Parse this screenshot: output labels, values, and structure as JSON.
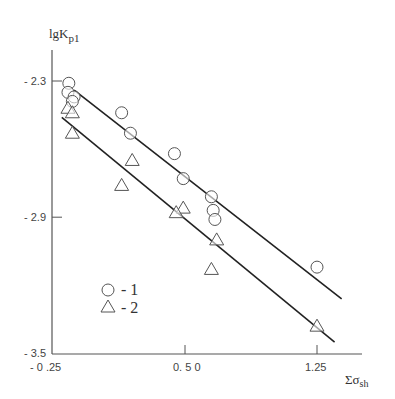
{
  "chart_data": {
    "type": "scatter",
    "title": "",
    "xlabel": "Σσsh",
    "ylabel": "lgKp1",
    "xlim": [
      -0.25,
      1.45
    ],
    "ylim": [
      -3.5,
      -2.2
    ],
    "x_ticks": [
      "-0.25",
      "0.50",
      "1.25"
    ],
    "y_ticks": [
      "-2.3",
      "-2.9",
      "-3.5"
    ],
    "grid": false,
    "legend_position": "lower-left inside",
    "series": [
      {
        "name": "1",
        "marker": "circle",
        "points": [
          [
            -0.16,
            -2.31
          ],
          [
            -0.165,
            -2.35
          ],
          [
            -0.13,
            -2.37
          ],
          [
            -0.14,
            -2.39
          ],
          [
            0.14,
            -2.44
          ],
          [
            0.19,
            -2.53
          ],
          [
            0.44,
            -2.62
          ],
          [
            0.49,
            -2.73
          ],
          [
            0.65,
            -2.81
          ],
          [
            0.66,
            -2.87
          ],
          [
            0.67,
            -2.91
          ],
          [
            1.25,
            -3.12
          ]
        ],
        "fit_line": [
          [
            -0.13,
            -2.34
          ],
          [
            1.39,
            -3.26
          ]
        ]
      },
      {
        "name": "2",
        "marker": "triangle",
        "points": [
          [
            -0.165,
            -2.42
          ],
          [
            -0.14,
            -2.44
          ],
          [
            -0.14,
            -2.53
          ],
          [
            0.2,
            -2.65
          ],
          [
            0.14,
            -2.76
          ],
          [
            0.49,
            -2.86
          ],
          [
            0.45,
            -2.88
          ],
          [
            0.68,
            -3.0
          ],
          [
            0.65,
            -3.13
          ],
          [
            1.25,
            -3.38
          ]
        ],
        "fit_line": [
          [
            -0.2,
            -2.46
          ],
          [
            1.35,
            -3.45
          ]
        ]
      }
    ]
  },
  "labels": {
    "y_axis": "lgK",
    "y_axis_sub": "p1",
    "x_axis": "Σσ",
    "x_axis_sub": "sh",
    "legend_1": "- 1",
    "legend_2": "- 2"
  }
}
